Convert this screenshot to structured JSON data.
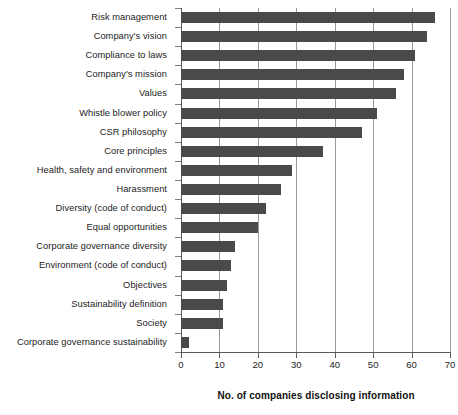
{
  "chart_data": {
    "type": "bar",
    "orientation": "horizontal",
    "title": "",
    "xlabel": "No. of companies disclosing information",
    "ylabel": "",
    "xlim": [
      0,
      70
    ],
    "xticks": [
      0,
      10,
      20,
      30,
      40,
      50,
      60,
      70
    ],
    "grid": "vertical",
    "legend": "none",
    "bar_color": "#4a4a4a",
    "axis_color": "#5a5a5a",
    "gridline_color": "#9a9a9a",
    "categories": [
      "Risk management",
      "Company's vision",
      "Compliance to laws",
      "Company's mission",
      "Values",
      "Whistle blower policy",
      "CSR philosophy",
      "Core principles",
      "Health, safety and environment",
      "Harassment",
      "Diversity (code of conduct)",
      "Equal opportunities",
      "Corporate governance diversity",
      "Environment (code of conduct)",
      "Objectives",
      "Sustainability definition",
      "Society",
      "Corporate governance sustainability"
    ],
    "values": [
      66,
      64,
      61,
      58,
      56,
      51,
      47,
      37,
      29,
      26,
      22,
      20,
      14,
      13,
      12,
      11,
      11,
      2
    ]
  }
}
